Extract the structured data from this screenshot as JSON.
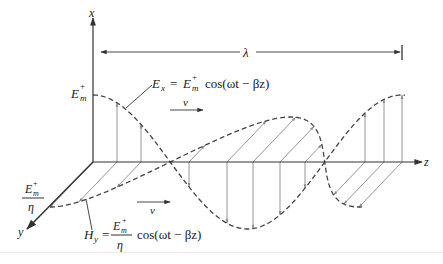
{
  "figure": {
    "axes": {
      "x_label": "x",
      "y_label": "y",
      "z_label": "z"
    },
    "wavelength_label": "λ",
    "velocity_label": "v",
    "e_field": {
      "amplitude_label": {
        "base": "E",
        "sub": "m",
        "sup": "+"
      },
      "equation": {
        "lhs_base": "E",
        "lhs_sub": "x",
        "equals": "=",
        "amp_base": "E",
        "amp_sub": "m",
        "amp_sup": "+",
        "func": "cos(ωt − βz)"
      }
    },
    "h_field": {
      "amplitude_label": {
        "num_base": "E",
        "num_sub": "m",
        "num_sup": "+",
        "den": "η"
      },
      "equation": {
        "lhs_base": "H",
        "lhs_sub": "y",
        "equals": "=",
        "num_base": "E",
        "num_sub": "m",
        "num_sup": "+",
        "den": "η",
        "func": "cos(ωt − βz)"
      }
    },
    "colors": {
      "axis": "#333333",
      "vectors": "#8a8a8a",
      "wave": "#444444"
    }
  }
}
